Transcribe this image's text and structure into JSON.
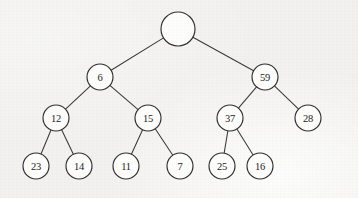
{
  "figure": {
    "background_color": "#f2f1ef",
    "node_fill_color": "#fdfdfc",
    "node_stroke_color": "#2f2f2f",
    "edge_color": "#3a3a3a",
    "label_color": "#242424"
  },
  "chart_data": {
    "type": "diagram",
    "diagram_kind": "binary-tree",
    "title": "",
    "levels": 4,
    "node_count": 15,
    "nodes": [
      {
        "id": "root",
        "label": "",
        "x": 178,
        "y": 29,
        "r": 17,
        "level": 0
      },
      {
        "id": "n6",
        "label": "6",
        "x": 100,
        "y": 77,
        "r": 13,
        "level": 1
      },
      {
        "id": "n59",
        "label": "59",
        "x": 265,
        "y": 77,
        "r": 13,
        "level": 1
      },
      {
        "id": "n12",
        "label": "12",
        "x": 56,
        "y": 118,
        "r": 13,
        "level": 2
      },
      {
        "id": "n15",
        "label": "15",
        "x": 148,
        "y": 118,
        "r": 13,
        "level": 2
      },
      {
        "id": "n37",
        "label": "37",
        "x": 230,
        "y": 118,
        "r": 13,
        "level": 2
      },
      {
        "id": "n28",
        "label": "28",
        "x": 308,
        "y": 118,
        "r": 13,
        "level": 2
      },
      {
        "id": "n23",
        "label": "23",
        "x": 36,
        "y": 166,
        "r": 13,
        "level": 3
      },
      {
        "id": "n14",
        "label": "14",
        "x": 79,
        "y": 166,
        "r": 13,
        "level": 3
      },
      {
        "id": "n11",
        "label": "11",
        "x": 126,
        "y": 166,
        "r": 13,
        "level": 3
      },
      {
        "id": "n7",
        "label": "7",
        "x": 180,
        "y": 166,
        "r": 13,
        "level": 3
      },
      {
        "id": "n25",
        "label": "25",
        "x": 222,
        "y": 166,
        "r": 13,
        "level": 3
      },
      {
        "id": "n16",
        "label": "16",
        "x": 260,
        "y": 166,
        "r": 13,
        "level": 3
      }
    ],
    "edges": [
      {
        "from": "root",
        "to": "n6"
      },
      {
        "from": "root",
        "to": "n59"
      },
      {
        "from": "n6",
        "to": "n12"
      },
      {
        "from": "n6",
        "to": "n15"
      },
      {
        "from": "n59",
        "to": "n37"
      },
      {
        "from": "n59",
        "to": "n28"
      },
      {
        "from": "n12",
        "to": "n23"
      },
      {
        "from": "n12",
        "to": "n14"
      },
      {
        "from": "n15",
        "to": "n11"
      },
      {
        "from": "n15",
        "to": "n7"
      },
      {
        "from": "n37",
        "to": "n25"
      },
      {
        "from": "n37",
        "to": "n16"
      }
    ]
  }
}
